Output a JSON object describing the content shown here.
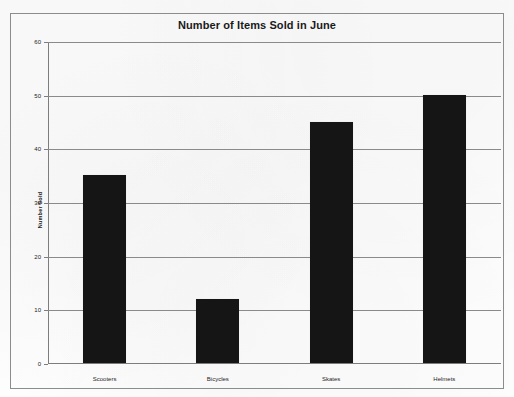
{
  "chart_data": {
    "type": "bar",
    "title": "Number of Items Sold in June",
    "xlabel": "",
    "ylabel": "Number Sold",
    "categories": [
      "Scooters",
      "Bicycles",
      "Skates",
      "Helmets"
    ],
    "values": [
      35,
      12,
      45,
      50
    ],
    "ylim": [
      0,
      60
    ],
    "yticks": [
      0,
      10,
      20,
      30,
      40,
      50,
      60
    ],
    "ytick_labels": [
      "0",
      "10",
      "20",
      "30",
      "40",
      "50",
      "60"
    ],
    "grid": true,
    "legend": "none",
    "bar_color": "#151515",
    "grid_color": "#8a8a8a",
    "axis_color": "#7d7d7d",
    "frame_color": "#8c8c8c",
    "background_color": "#fdfdfd"
  }
}
